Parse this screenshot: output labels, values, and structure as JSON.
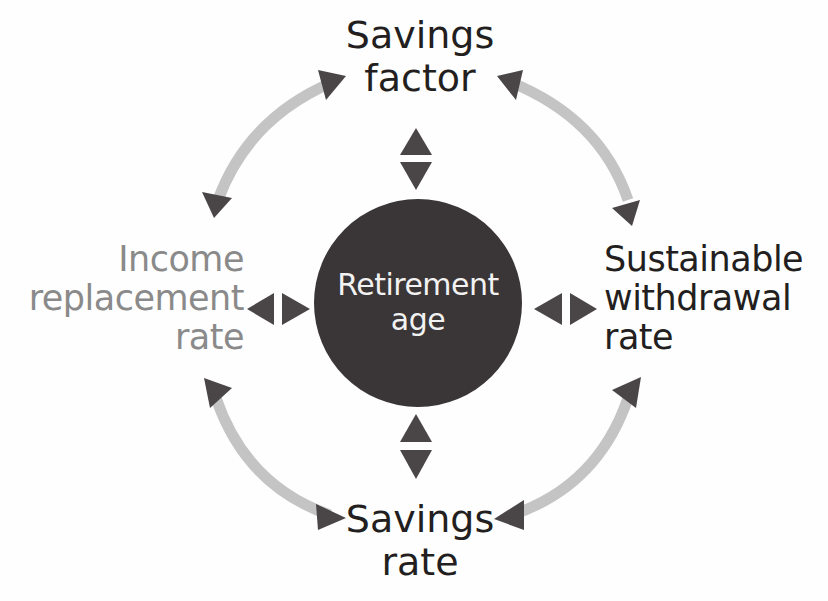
{
  "diagram": {
    "center": {
      "label_line1": "Retirement",
      "label_line2": "age",
      "fill": "#3a3536"
    },
    "nodes": {
      "top": {
        "line1": "Savings",
        "line2": "factor",
        "color": "#231f20"
      },
      "right": {
        "line1": "Sustainable",
        "line2": "withdrawal",
        "line3": "rate",
        "color": "#231f20"
      },
      "bottom": {
        "line1": "Savings",
        "line2": "rate",
        "color": "#231f20"
      },
      "left": {
        "line1": "Income",
        "line2": "replacement",
        "line3": "rate",
        "color": "#8a8a8a"
      }
    },
    "connections": [
      {
        "from": "Savings factor",
        "to": "Income replacement rate",
        "type": "curved-double-arrow"
      },
      {
        "from": "Savings factor",
        "to": "Sustainable withdrawal rate",
        "type": "curved-double-arrow"
      },
      {
        "from": "Income replacement rate",
        "to": "Savings rate",
        "type": "curved-double-arrow"
      },
      {
        "from": "Sustainable withdrawal rate",
        "to": "Savings rate",
        "type": "curved-double-arrow"
      },
      {
        "from": "Retirement age",
        "to": "Savings factor",
        "type": "double-arrowhead"
      },
      {
        "from": "Retirement age",
        "to": "Savings rate",
        "type": "double-arrowhead"
      },
      {
        "from": "Retirement age",
        "to": "Income replacement rate",
        "type": "double-arrowhead"
      },
      {
        "from": "Retirement age",
        "to": "Sustainable withdrawal rate",
        "type": "double-arrowhead"
      }
    ],
    "colors": {
      "arc": "#c4c4c4",
      "arrowhead": "#4a4546",
      "background": "#fefefe"
    }
  }
}
